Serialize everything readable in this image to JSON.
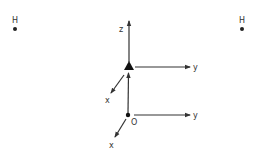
{
  "diagram": {
    "atoms": [
      {
        "label": "H",
        "position": "top-left"
      },
      {
        "label": "H",
        "position": "top-right"
      }
    ],
    "upper_frame": {
      "marker": "filled-triangle",
      "axes": {
        "z": "z",
        "y": "y",
        "x": "x"
      }
    },
    "lower_frame": {
      "origin_label": "O",
      "axes": {
        "y": "y",
        "x": "x"
      }
    },
    "colors": {
      "line": "#333333",
      "background": "#ffffff"
    }
  }
}
